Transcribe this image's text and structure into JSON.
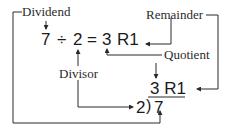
{
  "diagram": {
    "labels": {
      "dividend": "Dividend",
      "remainder": "Remainder",
      "quotient": "Quotient",
      "divisor": "Divisor"
    },
    "equation": {
      "dividend": "7",
      "operator": "÷",
      "divisor": "2",
      "equals": "=",
      "quotient": "3",
      "remainder": "R1"
    },
    "long_division": {
      "quotient_line": "3 R1",
      "divisor": "2",
      "bracket": ")",
      "dividend": "7"
    },
    "colors": {
      "line": "#2a2a2a",
      "text": "#1a1a1a",
      "background": "#ffffff"
    }
  }
}
